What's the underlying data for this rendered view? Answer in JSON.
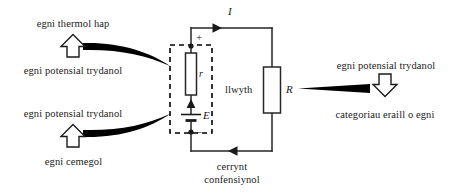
{
  "diagram": {
    "type": "circuit-diagram",
    "language": "cy",
    "colors": {
      "wire": "#1a1a1a",
      "text": "#1a1a1a",
      "background": "#ffffff",
      "dashed_box": "#000000",
      "pointer": "#000000"
    },
    "left_annotations": {
      "top_group": {
        "above_label": "egni thermol hap",
        "below_label": "egni potensial trydanol",
        "arrow_icon": "outline-up-arrow-icon",
        "arrow_direction": "up",
        "pointer_icon": "tapered-pointer-icon",
        "pointer_target": "internal-resistance-r"
      },
      "bottom_group": {
        "above_label": "egni potensial trydanol",
        "below_label": "egni cemegol",
        "arrow_icon": "outline-up-arrow-icon",
        "arrow_direction": "up",
        "pointer_icon": "tapered-pointer-icon",
        "pointer_target": "emf-source-E"
      }
    },
    "right_annotations": {
      "above_label": "egni potensial trydanol",
      "below_label": "categoriau eraill o egni",
      "arrow_icon": "outline-down-arrow-icon",
      "arrow_direction": "down",
      "pointer_icon": "tapered-pointer-icon",
      "pointer_target": "load-resistor-R"
    },
    "circuit": {
      "current_label": "I",
      "current_arrow_top_direction": "right",
      "current_arrow_bottom_direction": "left",
      "bottom_caption_line1": "cerrynt",
      "bottom_caption_line2": "confensiynol",
      "load_label": "llwyth",
      "load_symbol": "R",
      "internal_resistance_symbol": "r",
      "emf_symbol": "E",
      "terminal_positive": "+",
      "terminal_negative": "–",
      "source_box_style": "dashed",
      "source_box_name": "cell-with-internal-resistance"
    }
  }
}
